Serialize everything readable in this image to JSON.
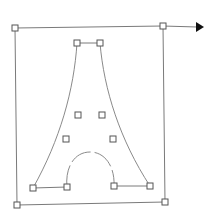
{
  "diagram": {
    "colors": {
      "background": "#ffffff",
      "stroke": "#7a7a7a",
      "handle": "#555555",
      "arrow": "#111111"
    },
    "bounding_quad": {
      "top_left": [
        15,
        28
      ],
      "top_right": [
        163,
        26
      ],
      "bottom_right": [
        165,
        202
      ],
      "bottom_left": [
        17,
        205
      ]
    },
    "arrow": {
      "from": [
        163,
        26
      ],
      "to": [
        203,
        27
      ]
    },
    "tower": {
      "top_left": [
        77,
        43
      ],
      "top_right": [
        100,
        43
      ],
      "bottom_outer_left": [
        33,
        188
      ],
      "bottom_inner_left": [
        67,
        187
      ],
      "bottom_inner_right": [
        114,
        186
      ],
      "bottom_outer_right": [
        150,
        186
      ],
      "arch_top": [
        90,
        152
      ]
    },
    "inner_handles": [
      [
        78,
        115
      ],
      [
        102,
        115
      ],
      [
        66,
        139
      ],
      [
        113,
        139
      ]
    ]
  }
}
